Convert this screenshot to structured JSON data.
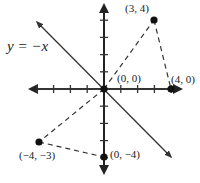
{
  "diagram": {
    "title": "",
    "line_label": "y = −x",
    "origin_px": [
      104,
      89
    ],
    "unit_px": [
      16.8,
      17.2
    ],
    "x_ticks": [
      -4,
      -3,
      -2,
      -1,
      1,
      2,
      3,
      4
    ],
    "y_ticks": [
      -4,
      -3,
      -2,
      -1,
      1,
      2,
      3,
      4
    ],
    "points": [
      {
        "label": "(0, 0)",
        "x": 0,
        "y": 0
      },
      {
        "label": "(3, 4)",
        "x": 3,
        "y": 4
      },
      {
        "label": "(4, 0)",
        "x": 4,
        "y": 0
      },
      {
        "label": "(−4, −3)",
        "x": -4,
        "y": -3
      },
      {
        "label": "(0, −4)",
        "x": 0,
        "y": -4
      }
    ],
    "dashed_triangles": [
      [
        "(0, 0)",
        "(3, 4)",
        "(4, 0)"
      ],
      [
        "(0, 0)",
        "(−4, −3)",
        "(0, −4)"
      ]
    ],
    "reflection_line": "y = −x",
    "colors": {
      "ink": "#222222",
      "axis": "#333333",
      "background": "#ffffff"
    }
  }
}
